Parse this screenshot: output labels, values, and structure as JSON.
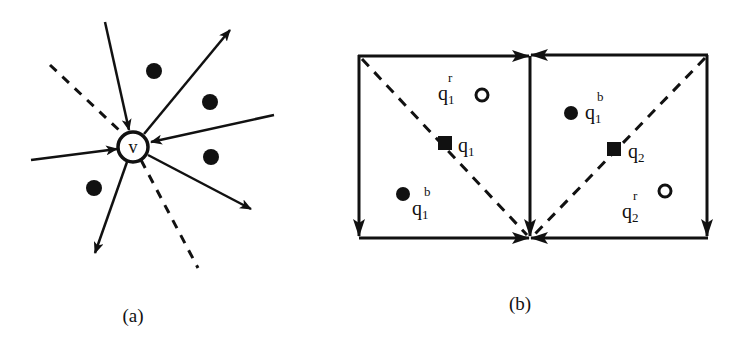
{
  "figure": {
    "panels": [
      {
        "id": "a",
        "caption": "(a)",
        "center_vertex": {
          "label": "v",
          "x": 133,
          "y": 147,
          "r": 15
        },
        "edges": [
          {
            "from": [
              105,
              22
            ],
            "to": [
              129,
              130
            ],
            "direction": "incoming"
          },
          {
            "from": [
              144,
              134
            ],
            "to": [
              230,
              30
            ],
            "direction": "outgoing"
          },
          {
            "from": [
              274,
              115
            ],
            "to": [
              151,
              142
            ],
            "direction": "incoming"
          },
          {
            "from": [
              31,
              160
            ],
            "to": [
              117,
              149
            ],
            "direction": "incoming"
          },
          {
            "from": [
              148,
              155
            ],
            "to": [
              251,
              209
            ],
            "direction": "outgoing"
          },
          {
            "from": [
              127,
              162
            ],
            "to": [
              95,
              253
            ],
            "direction": "outgoing"
          }
        ],
        "dashed_line": {
          "segments": [
            [
              [
                50,
                65
              ],
              [
                120,
                131
              ]
            ],
            [
              [
                141,
                160
              ],
              [
                198,
                268
              ]
            ]
          ]
        },
        "points": [
          {
            "x": 154,
            "y": 71
          },
          {
            "x": 210,
            "y": 102
          },
          {
            "x": 211,
            "y": 157
          },
          {
            "x": 94,
            "y": 188
          }
        ]
      },
      {
        "id": "b",
        "caption": "(b)",
        "cells": [
          {
            "name": "left-cell",
            "rect": [
              358,
              55,
              530,
              238
            ],
            "query_point": {
              "label": "q",
              "subscript": "1",
              "x": 445,
              "y": 143
            },
            "red_point": {
              "label": "q",
              "subscript": "1",
              "superscript": "r",
              "x": 482,
              "y": 95
            },
            "blue_point": {
              "label": "q",
              "subscript": "1",
              "superscript": "b",
              "x": 403,
              "y": 194
            },
            "diagonal": [
              [
                362,
                59
              ],
              [
                527,
                235
              ]
            ]
          },
          {
            "name": "right-cell",
            "rect": [
              530,
              55,
              708,
              238
            ],
            "query_point": {
              "label": "q",
              "subscript": "2",
              "x": 614,
              "y": 149
            },
            "red_point": {
              "label": "q",
              "subscript": "2",
              "superscript": "r",
              "x": 665,
              "y": 191
            },
            "blue_point": {
              "label": "q",
              "subscript": "1",
              "superscript": "b",
              "x": 571,
              "y": 113
            },
            "diagonal": [
              [
                705,
                58
              ],
              [
                534,
                235
              ]
            ]
          }
        ]
      }
    ],
    "labels": {
      "v": "v",
      "q": "q",
      "sub1": "1",
      "sub2": "2",
      "sup_r": "r",
      "sup_b": "b",
      "caption_a": "(a)",
      "caption_b": "(b)"
    },
    "colors": {
      "stroke": "#111111",
      "background": "#ffffff"
    }
  }
}
